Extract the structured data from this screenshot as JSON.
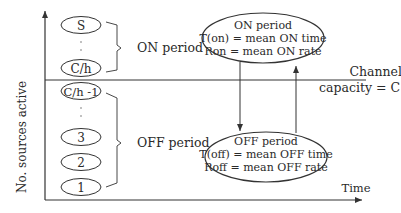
{
  "diagram": {
    "y_axis_label": "No. sources active",
    "x_axis_label": "Time",
    "channel_label_line1": "Channel",
    "channel_label_line2": "capacity = C",
    "on_states": [
      "S",
      "C/h"
    ],
    "off_states": [
      "C/h -1",
      "3",
      "2",
      "1"
    ],
    "on_group_label": "ON period",
    "off_group_label": "OFF period",
    "on_box": {
      "title": "ON period",
      "line1": "T(on) = mean ON time",
      "line2": "Ron = mean ON rate"
    },
    "off_box": {
      "title": "OFF period",
      "line1": "T(off) = mean OFF time",
      "line2": "Roff = mean OFF rate"
    },
    "colors": {
      "stroke": "#333333",
      "text": "#2a2a2a",
      "background": "#ffffff"
    }
  }
}
